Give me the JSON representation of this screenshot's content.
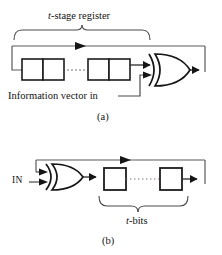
{
  "figure": {
    "panels": [
      {
        "id": "a",
        "caption": "(a)",
        "bracket_label_italic": "t",
        "bracket_label_rest": "-stage register",
        "bracket_label_full": "t-stage register",
        "input_label": "Information vector in",
        "gate": "xor-gate",
        "gate_inputs": 2,
        "register_cells_visible": 4,
        "ellipsis": "·····",
        "feedback_direction": "right-to-left"
      },
      {
        "id": "b",
        "caption": "(b)",
        "bracket_label_italic": "t",
        "bracket_label_rest": "-bits",
        "bracket_label_full": "t-bits",
        "input_label": "IN",
        "gate": "xor-gate",
        "gate_inputs": 2,
        "register_cells_visible": 2,
        "ellipsis": "·········",
        "feedback_direction": "right-to-left"
      }
    ],
    "colors": {
      "ink": "#121212",
      "line": "#3a3a3a",
      "background": "#ffffff"
    }
  }
}
